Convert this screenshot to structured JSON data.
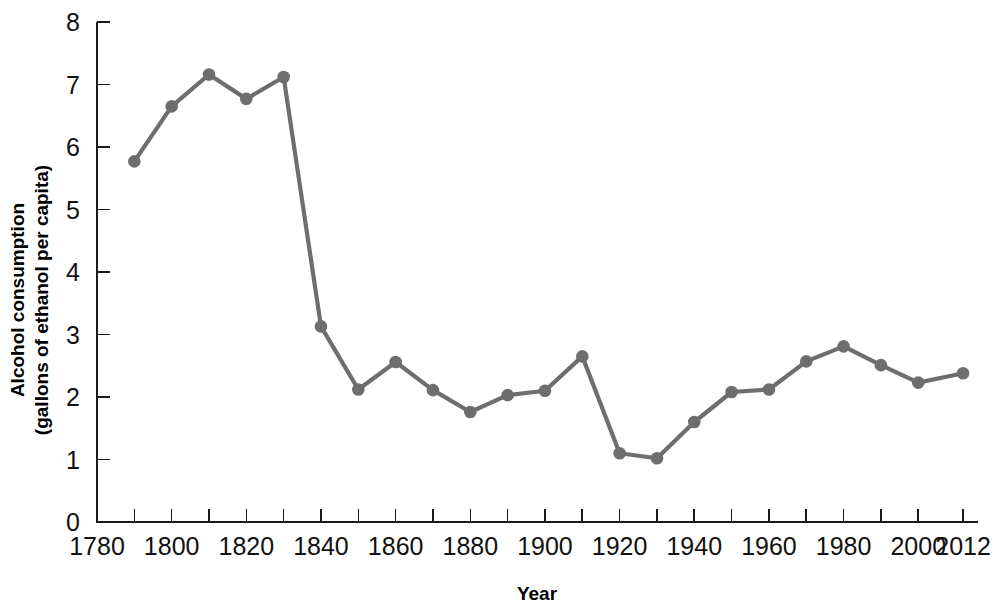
{
  "chart_data": {
    "type": "line",
    "title": "",
    "xlabel": "Year",
    "ylabel": "Alcohol consumption (gallons of ethanol per capita)",
    "ylabel_line1": "Alcohol consumption",
    "ylabel_line2": "(gallons of ethanol per capita)",
    "series_name": "Alcohol consumption",
    "line_color": "#6e6e6e",
    "marker_color": "#6e6e6e",
    "axis_color": "#1a1a1a",
    "grid": false,
    "legend": "none",
    "xlim": [
      1780,
      2016
    ],
    "ylim": [
      0,
      8
    ],
    "x_tick_step": 10,
    "x_label_step": 20,
    "y_tick_step": 1,
    "x_tick_values": [
      1780,
      1790,
      1800,
      1810,
      1820,
      1830,
      1840,
      1850,
      1860,
      1870,
      1880,
      1890,
      1900,
      1910,
      1920,
      1930,
      1940,
      1950,
      1960,
      1970,
      1980,
      1990,
      2000,
      2012
    ],
    "x_tick_labels": [
      "1780",
      "",
      "1800",
      "",
      "1820",
      "",
      "1840",
      "",
      "1860",
      "",
      "1880",
      "",
      "1900",
      "",
      "1920",
      "",
      "1940",
      "",
      "1960",
      "",
      "1980",
      "",
      "2000",
      "2012"
    ],
    "y_tick_values": [
      0,
      1,
      2,
      3,
      4,
      5,
      6,
      7,
      8
    ],
    "y_tick_labels": [
      "0",
      "1",
      "2",
      "3",
      "4",
      "5",
      "6",
      "7",
      "8"
    ],
    "x": [
      1790,
      1800,
      1810,
      1820,
      1830,
      1840,
      1850,
      1860,
      1870,
      1880,
      1890,
      1900,
      1910,
      1920,
      1930,
      1940,
      1950,
      1960,
      1970,
      1980,
      1990,
      2000,
      2012
    ],
    "values": [
      5.77,
      6.65,
      7.16,
      6.77,
      7.12,
      3.13,
      2.12,
      2.56,
      2.11,
      1.76,
      2.03,
      2.1,
      2.65,
      1.1,
      1.02,
      1.6,
      2.08,
      2.12,
      2.57,
      2.81,
      2.51,
      2.23,
      2.38
    ]
  }
}
